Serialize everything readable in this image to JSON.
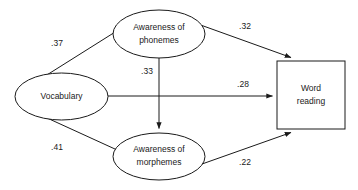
{
  "diagram": {
    "type": "path-diagram",
    "nodes": [
      {
        "id": "vocabulary",
        "shape": "ellipse",
        "lines": [
          "Vocabulary"
        ],
        "cx": 61.5,
        "cy": 96.5,
        "rx": 46.5,
        "ry": 23.5
      },
      {
        "id": "awareness-phonemes",
        "shape": "ellipse",
        "lines": [
          "Awareness of",
          "phonemes"
        ],
        "cx": 159,
        "cy": 34,
        "rx": 46,
        "ry": 24
      },
      {
        "id": "awareness-morphemes",
        "shape": "ellipse",
        "lines": [
          "Awareness of",
          "morphemes"
        ],
        "cx": 159,
        "cy": 156.5,
        "rx": 46,
        "ry": 23.5
      },
      {
        "id": "word-reading",
        "shape": "rectangle",
        "lines": [
          "Word",
          "reading"
        ],
        "x": 277,
        "y": 61,
        "width": 68,
        "height": 68
      }
    ],
    "edges": [
      {
        "id": "vocabulary-to-phonemes",
        "from": "vocabulary",
        "to": "awareness-phonemes",
        "coefficient": ".37",
        "label_x": 57,
        "label_y": 44
      },
      {
        "id": "vocabulary-to-morphemes",
        "from": "vocabulary",
        "to": "awareness-morphemes",
        "coefficient": ".41",
        "label_x": 57,
        "label_y": 148
      },
      {
        "id": "phonemes-to-morphemes",
        "from": "awareness-phonemes",
        "to": "awareness-morphemes",
        "coefficient": ".33",
        "label_x": 147,
        "label_y": 72
      },
      {
        "id": "phonemes-to-word-reading",
        "from": "awareness-phonemes",
        "to": "word-reading",
        "coefficient": ".32",
        "label_x": 245,
        "label_y": 27
      },
      {
        "id": "vocabulary-to-word-reading",
        "from": "vocabulary",
        "to": "word-reading",
        "coefficient": ".28",
        "label_x": 243,
        "label_y": 85
      },
      {
        "id": "morphemes-to-word-reading",
        "from": "awareness-morphemes",
        "to": "word-reading",
        "coefficient": ".22",
        "label_x": 245,
        "label_y": 163
      }
    ]
  }
}
